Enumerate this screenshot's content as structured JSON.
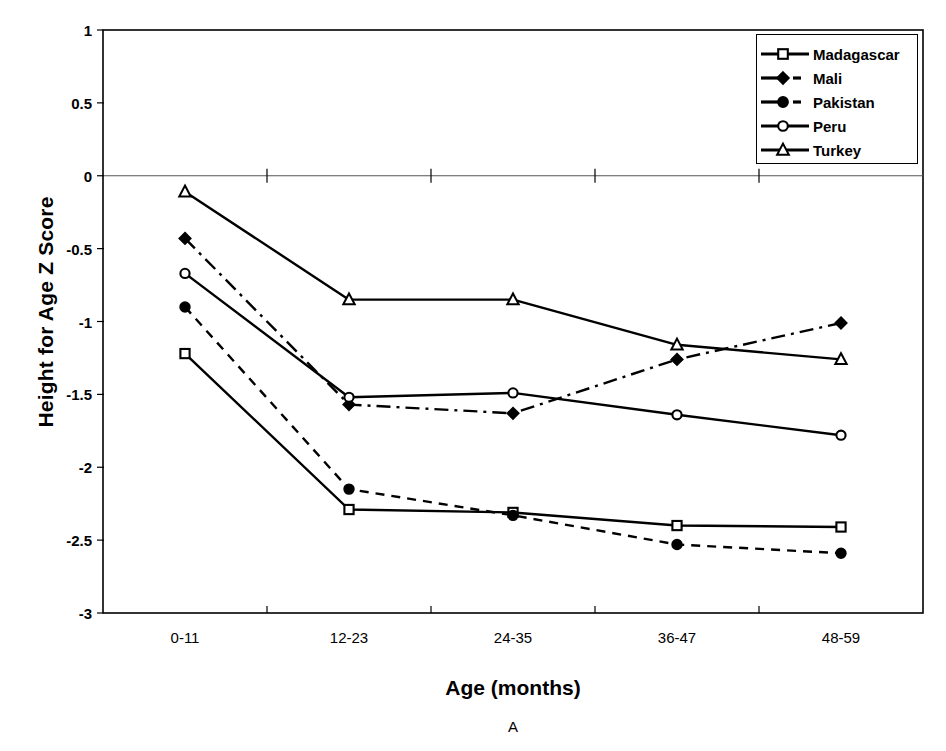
{
  "chart_data": {
    "type": "line",
    "title": "",
    "panel_label": "A",
    "xlabel": "Age (months)",
    "ylabel": "Height for Age Z Score",
    "categories": [
      "0-11",
      "12-23",
      "24-35",
      "36-47",
      "48-59"
    ],
    "ylim": [
      -3,
      1
    ],
    "yticks": [
      1,
      0.5,
      0,
      -0.5,
      -1,
      -1.5,
      -2,
      -2.5,
      -3
    ],
    "ytick_labels": [
      "1",
      "0.5",
      "0",
      "-0.5",
      "-1",
      "-1.5",
      "-2",
      "-2.5",
      "-3"
    ],
    "grid": false,
    "zero_line": true,
    "legend_position": "top-right",
    "series": [
      {
        "name": "Madagascar",
        "marker": "open-square",
        "line": "solid",
        "color": "#000000",
        "values": [
          -1.22,
          -2.29,
          -2.31,
          -2.4,
          -2.41
        ]
      },
      {
        "name": "Mali",
        "marker": "filled-diamond",
        "line": "dash-dot",
        "color": "#000000",
        "values": [
          -0.43,
          -1.57,
          -1.63,
          -1.26,
          -1.01
        ]
      },
      {
        "name": "Pakistan",
        "marker": "filled-circle",
        "line": "dashed",
        "color": "#000000",
        "values": [
          -0.9,
          -2.15,
          -2.33,
          -2.53,
          -2.59
        ]
      },
      {
        "name": "Peru",
        "marker": "open-circle",
        "line": "solid",
        "color": "#000000",
        "values": [
          -0.67,
          -1.52,
          -1.49,
          -1.64,
          -1.78
        ]
      },
      {
        "name": "Turkey",
        "marker": "open-triangle",
        "line": "solid",
        "color": "#000000",
        "values": [
          -0.11,
          -0.85,
          -0.85,
          -1.16,
          -1.26
        ]
      }
    ]
  },
  "legend": {
    "items": [
      {
        "label": "Madagascar"
      },
      {
        "label": "Mali"
      },
      {
        "label": "Pakistan"
      },
      {
        "label": "Peru"
      },
      {
        "label": "Turkey"
      }
    ]
  }
}
